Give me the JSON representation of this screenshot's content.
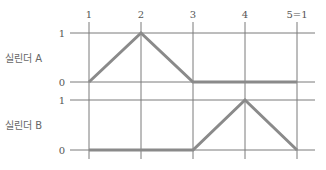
{
  "diagram": {
    "type": "displacement-step-diagram",
    "steps": [
      "1",
      "2",
      "3",
      "4",
      "5=1"
    ],
    "cylinders": [
      {
        "label": "실린더 A",
        "levels": [
          "0",
          "1"
        ],
        "values": [
          0,
          1,
          0,
          0,
          0
        ]
      },
      {
        "label": "실린더 B",
        "levels": [
          "0",
          "1"
        ],
        "values": [
          0,
          0,
          0,
          1,
          0
        ]
      }
    ],
    "colors": {
      "grid": "#7a7a7a",
      "trace": "#8a8a8a",
      "text": "#555555"
    }
  }
}
